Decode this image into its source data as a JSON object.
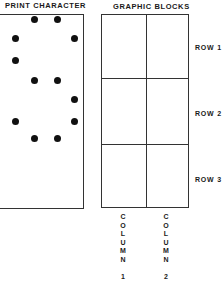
{
  "print_character": {
    "title": "PRINT CHARACTER",
    "dots": [
      {
        "col": 2,
        "row": 1
      },
      {
        "col": 3,
        "row": 1
      },
      {
        "col": 1,
        "row": 2
      },
      {
        "col": 4,
        "row": 2
      },
      {
        "col": 1,
        "row": 3
      },
      {
        "col": 2,
        "row": 4
      },
      {
        "col": 3,
        "row": 4
      },
      {
        "col": 4,
        "row": 5
      },
      {
        "col": 1,
        "row": 6
      },
      {
        "col": 4,
        "row": 6
      },
      {
        "col": 2,
        "row": 7
      },
      {
        "col": 3,
        "row": 7
      }
    ]
  },
  "graphic_blocks": {
    "title": "GRAPHIC BLOCKS",
    "rows": [
      "ROW 1",
      "ROW 2",
      "ROW 3"
    ],
    "columns": [
      {
        "letters": [
          "C",
          "O",
          "L",
          "U",
          "M",
          "N"
        ],
        "number": "1"
      },
      {
        "letters": [
          "C",
          "O",
          "L",
          "U",
          "M",
          "N"
        ],
        "number": "2"
      }
    ]
  }
}
